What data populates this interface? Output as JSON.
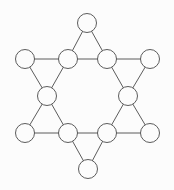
{
  "diagram": {
    "shape_name": "star-of-david-graph",
    "background_color": "#fcfcfc",
    "stroke_color": "#4a4a4a",
    "node_fill_color": "#fcfcfc",
    "stroke_width": 0.9,
    "node_radius": 9.5,
    "node_count": 12,
    "edge_count": 18,
    "triangle_count": 6,
    "canvas": {
      "width": 174,
      "height": 190
    },
    "nodes": [
      {
        "id": "top-apex",
        "label": "",
        "cx": 87,
        "cy": 23,
        "r": 9.5,
        "role": "outer-tip"
      },
      {
        "id": "left-upper-tip",
        "label": "",
        "cx": 25,
        "cy": 59,
        "r": 9.5,
        "role": "outer-tip"
      },
      {
        "id": "inner-top-left",
        "label": "",
        "cx": 68,
        "cy": 59,
        "r": 9.5,
        "role": "inner-hex"
      },
      {
        "id": "inner-top-right",
        "label": "",
        "cx": 107,
        "cy": 59,
        "r": 9.5,
        "role": "inner-hex"
      },
      {
        "id": "right-upper-tip",
        "label": "",
        "cx": 150,
        "cy": 59,
        "r": 9.5,
        "role": "outer-tip"
      },
      {
        "id": "inner-left",
        "label": "",
        "cx": 47,
        "cy": 96,
        "r": 9.5,
        "role": "inner-hex"
      },
      {
        "id": "inner-right",
        "label": "",
        "cx": 128,
        "cy": 96,
        "r": 9.5,
        "role": "inner-hex"
      },
      {
        "id": "left-lower-tip",
        "label": "",
        "cx": 25,
        "cy": 133,
        "r": 9.5,
        "role": "outer-tip"
      },
      {
        "id": "inner-bottom-left",
        "label": "",
        "cx": 68,
        "cy": 133,
        "r": 9.5,
        "role": "inner-hex"
      },
      {
        "id": "inner-bottom-right",
        "label": "",
        "cx": 107,
        "cy": 133,
        "r": 9.5,
        "role": "inner-hex"
      },
      {
        "id": "right-lower-tip",
        "label": "",
        "cx": 150,
        "cy": 133,
        "r": 9.5,
        "role": "outer-tip"
      },
      {
        "id": "bottom-apex",
        "label": "",
        "cx": 88,
        "cy": 169,
        "r": 9.5,
        "role": "outer-tip"
      }
    ],
    "edges": [
      {
        "id": "e1",
        "from": "top-apex",
        "to": "inner-top-left",
        "triangle": "top"
      },
      {
        "id": "e2",
        "from": "top-apex",
        "to": "inner-top-right",
        "triangle": "top"
      },
      {
        "id": "e3",
        "from": "inner-top-left",
        "to": "inner-top-right",
        "triangle": "top"
      },
      {
        "id": "e4",
        "from": "left-upper-tip",
        "to": "inner-top-left",
        "triangle": "upper-left"
      },
      {
        "id": "e5",
        "from": "left-upper-tip",
        "to": "inner-left",
        "triangle": "upper-left"
      },
      {
        "id": "e6",
        "from": "inner-top-left",
        "to": "inner-left",
        "triangle": "upper-left"
      },
      {
        "id": "e7",
        "from": "inner-top-right",
        "to": "right-upper-tip",
        "triangle": "upper-right"
      },
      {
        "id": "e8",
        "from": "right-upper-tip",
        "to": "inner-right",
        "triangle": "upper-right"
      },
      {
        "id": "e9",
        "from": "inner-top-right",
        "to": "inner-right",
        "triangle": "upper-right"
      },
      {
        "id": "e10",
        "from": "inner-left",
        "to": "left-lower-tip",
        "triangle": "lower-left"
      },
      {
        "id": "e11",
        "from": "inner-left",
        "to": "inner-bottom-left",
        "triangle": "lower-left"
      },
      {
        "id": "e12",
        "from": "left-lower-tip",
        "to": "inner-bottom-left",
        "triangle": "lower-left"
      },
      {
        "id": "e13",
        "from": "inner-right",
        "to": "right-lower-tip",
        "triangle": "lower-right"
      },
      {
        "id": "e14",
        "from": "inner-right",
        "to": "inner-bottom-right",
        "triangle": "lower-right"
      },
      {
        "id": "e15",
        "from": "inner-bottom-right",
        "to": "right-lower-tip",
        "triangle": "lower-right"
      },
      {
        "id": "e16",
        "from": "inner-bottom-left",
        "to": "inner-bottom-right",
        "triangle": "bottom"
      },
      {
        "id": "e17",
        "from": "inner-bottom-left",
        "to": "bottom-apex",
        "triangle": "bottom"
      },
      {
        "id": "e18",
        "from": "inner-bottom-right",
        "to": "bottom-apex",
        "triangle": "bottom"
      }
    ]
  }
}
